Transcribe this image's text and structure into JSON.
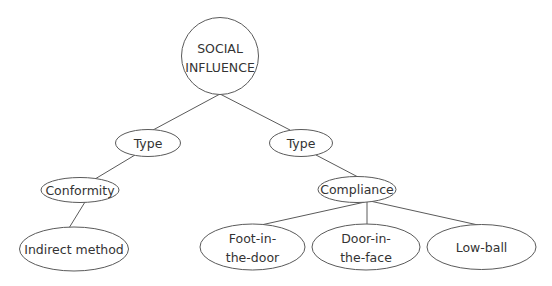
{
  "diagram": {
    "type": "tree",
    "title": "SOCIAL INFLUENCE",
    "nodes": [
      {
        "id": "root",
        "lines": [
          "SOCIAL",
          "INFLUENCE"
        ],
        "shape": "circle"
      },
      {
        "id": "type-left",
        "lines": [
          "Type"
        ],
        "shape": "ellipse"
      },
      {
        "id": "type-right",
        "lines": [
          "Type"
        ],
        "shape": "ellipse"
      },
      {
        "id": "conformity",
        "lines": [
          "Conformity"
        ],
        "shape": "ellipse"
      },
      {
        "id": "indirect-method",
        "lines": [
          "Indirect method"
        ],
        "shape": "ellipse"
      },
      {
        "id": "compliance",
        "lines": [
          "Compliance"
        ],
        "shape": "ellipse"
      },
      {
        "id": "foot-in-the-door",
        "lines": [
          "Foot-in-",
          "the-door"
        ],
        "shape": "ellipse"
      },
      {
        "id": "door-in-the-face",
        "lines": [
          "Door-in-",
          "the-face"
        ],
        "shape": "ellipse"
      },
      {
        "id": "low-ball",
        "lines": [
          "Low-ball"
        ],
        "shape": "ellipse"
      }
    ],
    "edges": [
      {
        "from": "root",
        "to": "type-left"
      },
      {
        "from": "root",
        "to": "type-right"
      },
      {
        "from": "type-left",
        "to": "conformity"
      },
      {
        "from": "conformity",
        "to": "indirect-method"
      },
      {
        "from": "type-right",
        "to": "compliance"
      },
      {
        "from": "compliance",
        "to": "foot-in-the-door"
      },
      {
        "from": "compliance",
        "to": "door-in-the-face"
      },
      {
        "from": "compliance",
        "to": "low-ball"
      }
    ],
    "colors": {
      "stroke": "#5a5a5a",
      "text": "#333333",
      "background": "#ffffff"
    }
  }
}
